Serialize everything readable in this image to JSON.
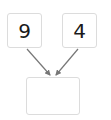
{
  "diagram": {
    "inputs": [
      {
        "value": "9"
      },
      {
        "value": "4"
      }
    ],
    "result": {
      "value": ""
    },
    "colors": {
      "box_border": "#dcdcdc",
      "arrow": "#777777",
      "text": "#1a1a1a"
    }
  }
}
